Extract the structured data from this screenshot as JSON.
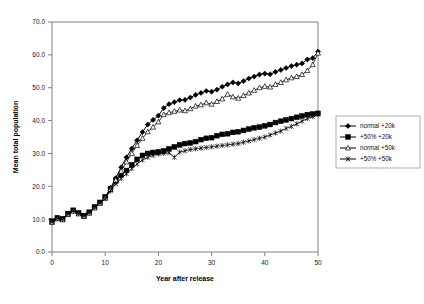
{
  "chart_data": {
    "type": "line",
    "title": "",
    "xlabel": "Year after release",
    "ylabel": "Mean total population",
    "xlim": [
      0,
      50
    ],
    "ylim": [
      0,
      70
    ],
    "xticks": [
      0,
      10,
      20,
      30,
      40,
      50
    ],
    "yticks": [
      "0.0",
      "10.0",
      "20.0",
      "30.0",
      "40.0",
      "50.0",
      "60.0",
      "70.0"
    ],
    "ytick_values": [
      0,
      10,
      20,
      30,
      40,
      50,
      60,
      70
    ],
    "grid": false,
    "legend_position": "right",
    "x": [
      0,
      1,
      2,
      3,
      4,
      5,
      6,
      7,
      8,
      9,
      10,
      11,
      12,
      13,
      14,
      15,
      16,
      17,
      18,
      19,
      20,
      21,
      22,
      23,
      24,
      25,
      26,
      27,
      28,
      29,
      30,
      31,
      32,
      33,
      34,
      35,
      36,
      37,
      38,
      39,
      40,
      41,
      42,
      43,
      44,
      45,
      46,
      47,
      48,
      49,
      50
    ],
    "series": [
      {
        "name": "normal +20k",
        "marker": "filled-diamond",
        "values": [
          9.2,
          10.3,
          10.0,
          11.6,
          12.6,
          11.8,
          11.0,
          12.0,
          13.6,
          15.0,
          16.6,
          19.5,
          22.5,
          25.8,
          28.8,
          31.5,
          34.0,
          36.5,
          38.8,
          40.2,
          41.5,
          43.8,
          45.0,
          45.6,
          46.2,
          46.3,
          47.0,
          47.8,
          48.4,
          49.0,
          48.8,
          49.4,
          50.3,
          51.0,
          51.6,
          51.3,
          52.0,
          52.8,
          53.4,
          54.0,
          54.3,
          54.1,
          54.8,
          55.4,
          56.0,
          56.6,
          57.0,
          57.4,
          58.6,
          59.0,
          61.0
        ]
      },
      {
        "name": "+50% +20k",
        "marker": "filled-square",
        "values": [
          9.4,
          10.4,
          10.1,
          11.7,
          12.7,
          11.9,
          11.1,
          12.1,
          13.7,
          15.1,
          16.8,
          19.2,
          21.6,
          23.4,
          24.8,
          26.5,
          28.2,
          29.4,
          30.0,
          30.3,
          30.5,
          30.8,
          31.4,
          32.0,
          32.6,
          33.0,
          33.2,
          33.6,
          34.2,
          34.6,
          34.8,
          35.4,
          35.8,
          36.0,
          36.4,
          36.6,
          37.0,
          37.4,
          37.8,
          38.0,
          38.4,
          38.8,
          39.4,
          39.8,
          40.2,
          40.6,
          41.0,
          41.4,
          41.8,
          42.0,
          42.2
        ]
      },
      {
        "name": "normal +50k",
        "marker": "open-triangle",
        "values": [
          9.0,
          10.1,
          9.8,
          11.4,
          12.4,
          11.6,
          10.8,
          11.8,
          13.4,
          14.8,
          16.4,
          19.0,
          21.8,
          24.6,
          27.4,
          30.0,
          32.4,
          34.6,
          36.6,
          38.0,
          39.6,
          41.8,
          42.4,
          42.8,
          43.2,
          43.0,
          43.6,
          44.4,
          44.8,
          45.4,
          45.0,
          45.8,
          46.6,
          48.0,
          47.2,
          46.8,
          47.6,
          48.4,
          49.2,
          50.0,
          50.4,
          50.2,
          51.0,
          51.6,
          52.4,
          53.0,
          53.4,
          54.0,
          55.2,
          57.0,
          60.5
        ]
      },
      {
        "name": "+50% +50k",
        "marker": "star-x",
        "values": [
          9.1,
          10.2,
          9.9,
          11.5,
          12.5,
          11.7,
          10.9,
          11.9,
          13.5,
          14.9,
          16.2,
          18.6,
          20.8,
          22.4,
          23.8,
          25.4,
          26.8,
          28.0,
          28.8,
          29.4,
          29.8,
          30.0,
          30.2,
          28.8,
          30.4,
          30.8,
          31.2,
          31.4,
          31.6,
          31.8,
          32.0,
          32.2,
          32.4,
          32.6,
          32.8,
          33.0,
          33.4,
          33.8,
          34.2,
          34.6,
          35.0,
          35.6,
          36.2,
          36.8,
          37.6,
          38.2,
          39.0,
          39.8,
          40.6,
          41.2,
          41.8
        ]
      }
    ]
  },
  "legend": {
    "items": [
      {
        "label": "normal +20k",
        "marker": "filled-diamond"
      },
      {
        "label": "+50% +20k",
        "marker": "filled-square"
      },
      {
        "label": "normal +50k",
        "marker": "open-triangle"
      },
      {
        "label": "+50% +50k",
        "marker": "star-x"
      }
    ]
  }
}
